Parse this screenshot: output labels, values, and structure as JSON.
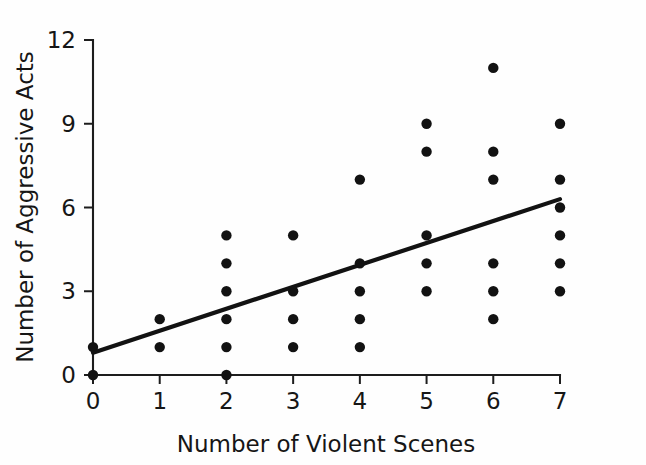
{
  "chart_data": {
    "type": "scatter",
    "title": "",
    "xlabel": "Number of Violent Scenes",
    "ylabel": "Number of Aggressive Acts",
    "xlim": [
      0,
      7
    ],
    "ylim": [
      0,
      12
    ],
    "xticks": [
      0,
      1,
      2,
      3,
      4,
      5,
      6,
      7
    ],
    "yticks": [
      0,
      3,
      6,
      9,
      12
    ],
    "xtick_labels": [
      "0",
      "1",
      "2",
      "3",
      "4",
      "5",
      "6",
      "7"
    ],
    "ytick_labels": [
      "0",
      "3",
      "6",
      "9",
      "12"
    ],
    "grid": false,
    "legend": "none",
    "marker": "filled-circle",
    "marker_color": "#121212",
    "points": [
      {
        "x": 0,
        "y": 0
      },
      {
        "x": 0,
        "y": 1
      },
      {
        "x": 1,
        "y": 1
      },
      {
        "x": 1,
        "y": 2
      },
      {
        "x": 2,
        "y": 0
      },
      {
        "x": 2,
        "y": 1
      },
      {
        "x": 2,
        "y": 2
      },
      {
        "x": 2,
        "y": 3
      },
      {
        "x": 2,
        "y": 4
      },
      {
        "x": 2,
        "y": 5
      },
      {
        "x": 3,
        "y": 1
      },
      {
        "x": 3,
        "y": 2
      },
      {
        "x": 3,
        "y": 3
      },
      {
        "x": 3,
        "y": 5
      },
      {
        "x": 4,
        "y": 1
      },
      {
        "x": 4,
        "y": 2
      },
      {
        "x": 4,
        "y": 3
      },
      {
        "x": 4,
        "y": 4
      },
      {
        "x": 4,
        "y": 7
      },
      {
        "x": 5,
        "y": 3
      },
      {
        "x": 5,
        "y": 4
      },
      {
        "x": 5,
        "y": 5
      },
      {
        "x": 5,
        "y": 8
      },
      {
        "x": 5,
        "y": 9
      },
      {
        "x": 6,
        "y": 2
      },
      {
        "x": 6,
        "y": 3
      },
      {
        "x": 6,
        "y": 4
      },
      {
        "x": 6,
        "y": 7
      },
      {
        "x": 6,
        "y": 8
      },
      {
        "x": 6,
        "y": 11
      },
      {
        "x": 7,
        "y": 3
      },
      {
        "x": 7,
        "y": 4
      },
      {
        "x": 7,
        "y": 5
      },
      {
        "x": 7,
        "y": 6
      },
      {
        "x": 7,
        "y": 7
      },
      {
        "x": 7,
        "y": 9
      }
    ],
    "trendline": {
      "name": "regression-line",
      "x0": 0,
      "y0": 0.8,
      "x1": 7,
      "y1": 6.3,
      "color": "#121212"
    }
  }
}
